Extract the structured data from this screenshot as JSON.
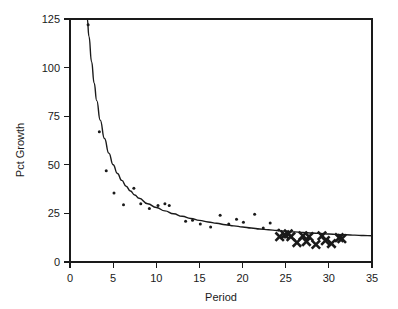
{
  "chart_data": {
    "type": "scatter",
    "title": "",
    "subtitle": "",
    "xlabel": "Period",
    "ylabel": "Pct Growth",
    "xlim": [
      0,
      35
    ],
    "ylim": [
      0,
      125
    ],
    "xticks": [
      0,
      5,
      10,
      15,
      20,
      25,
      30,
      35
    ],
    "yticks": [
      0,
      25,
      50,
      75,
      100,
      125
    ],
    "xtick_labels": [
      "0",
      "5",
      "10",
      "15",
      "20",
      "25",
      "30",
      "35"
    ],
    "ytick_labels": [
      "0",
      "25",
      "50",
      "75",
      "100",
      "125"
    ],
    "grid": false,
    "legend": null,
    "legend_position": "none",
    "background_color": "#ffffff",
    "foreground_color": "#1a1a1a",
    "series": [
      {
        "name": "Observed growth (small dots)",
        "marker": "dot",
        "color": "#1a1a1a",
        "points": [
          [
            2.1,
            122.0
          ],
          [
            3.4,
            67.0
          ],
          [
            4.2,
            47.0
          ],
          [
            5.1,
            35.5
          ],
          [
            6.2,
            29.5
          ],
          [
            7.4,
            38.0
          ],
          [
            8.2,
            30.0
          ],
          [
            9.2,
            27.5
          ],
          [
            10.2,
            29.0
          ],
          [
            11.0,
            30.0
          ],
          [
            11.5,
            29.0
          ],
          [
            13.4,
            21.0
          ],
          [
            14.2,
            21.5
          ],
          [
            15.1,
            19.5
          ],
          [
            16.3,
            18.0
          ],
          [
            17.4,
            24.0
          ],
          [
            18.4,
            19.5
          ],
          [
            19.3,
            22.0
          ],
          [
            20.1,
            20.5
          ],
          [
            21.4,
            24.5
          ],
          [
            22.4,
            17.5
          ],
          [
            23.2,
            20.0
          ],
          [
            24.2,
            16.5
          ]
        ]
      },
      {
        "name": "Recent periods (bold X markers)",
        "marker": "x",
        "color": "#1a1a1a",
        "points": [
          [
            24.3,
            13.0
          ],
          [
            24.9,
            14.0
          ],
          [
            25.3,
            14.5
          ],
          [
            25.6,
            13.0
          ],
          [
            26.3,
            10.0
          ],
          [
            27.0,
            13.5
          ],
          [
            27.4,
            10.5
          ],
          [
            27.7,
            13.0
          ],
          [
            28.5,
            9.0
          ],
          [
            29.2,
            13.5
          ],
          [
            29.6,
            11.0
          ],
          [
            30.3,
            9.5
          ],
          [
            31.2,
            12.5
          ],
          [
            31.5,
            12.0
          ]
        ]
      }
    ],
    "fit_curve": {
      "name": "Fitted decay curve",
      "color": "#1a1a1a",
      "points": [
        [
          2.0,
          125.0
        ],
        [
          2.2,
          116.0
        ],
        [
          2.5,
          103.0
        ],
        [
          2.8,
          92.0
        ],
        [
          3.1,
          83.0
        ],
        [
          3.5,
          73.0
        ],
        [
          4.0,
          63.5
        ],
        [
          4.5,
          56.0
        ],
        [
          5.0,
          50.0
        ],
        [
          5.5,
          45.5
        ],
        [
          6.0,
          42.0
        ],
        [
          6.5,
          39.0
        ],
        [
          7.0,
          36.5
        ],
        [
          7.5,
          34.5
        ],
        [
          8.0,
          32.8
        ],
        [
          9.0,
          30.0
        ],
        [
          10.0,
          28.0
        ],
        [
          11.0,
          26.3
        ],
        [
          12.0,
          24.8
        ],
        [
          13.0,
          23.5
        ],
        [
          14.0,
          22.4
        ],
        [
          15.0,
          21.4
        ],
        [
          16.0,
          20.6
        ],
        [
          17.0,
          19.9
        ],
        [
          18.0,
          19.2
        ],
        [
          19.0,
          18.6
        ],
        [
          20.0,
          18.0
        ],
        [
          21.0,
          17.5
        ],
        [
          22.0,
          17.0
        ],
        [
          23.0,
          16.6
        ],
        [
          24.0,
          16.2
        ],
        [
          25.0,
          15.8
        ],
        [
          26.0,
          15.5
        ],
        [
          27.0,
          15.2
        ],
        [
          28.0,
          14.9
        ],
        [
          29.0,
          14.7
        ],
        [
          30.0,
          14.4
        ],
        [
          31.0,
          14.2
        ],
        [
          32.0,
          14.0
        ],
        [
          33.0,
          13.8
        ],
        [
          34.0,
          13.6
        ],
        [
          35.0,
          13.5
        ]
      ]
    }
  }
}
